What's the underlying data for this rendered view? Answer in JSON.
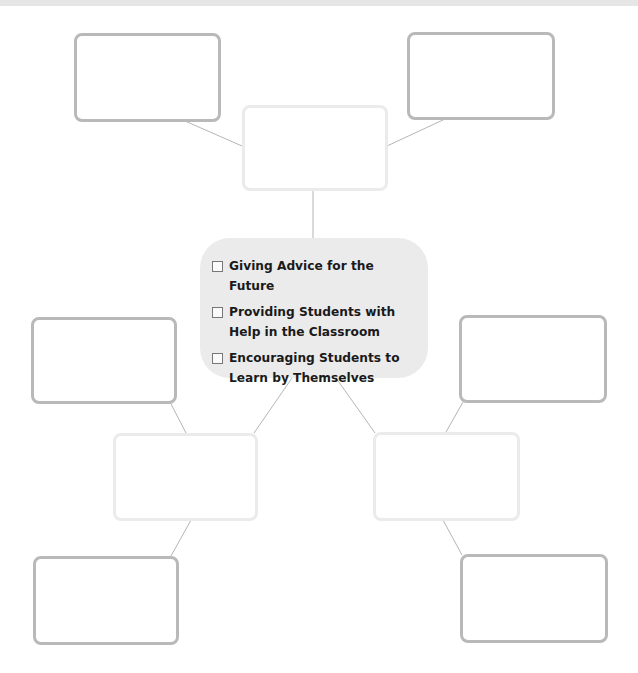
{
  "center": {
    "items": [
      {
        "label": "Giving Advice for the Future",
        "checked": false
      },
      {
        "label": "Providing Students with Help in the Classroom",
        "checked": false
      },
      {
        "label": "Encouraging Students to Learn by Themselves",
        "checked": false
      }
    ]
  },
  "nodes": {
    "top_left": "",
    "top_right": "",
    "top_middle": "",
    "mid_left": "",
    "mid_right": "",
    "lower_left": "",
    "lower_right": "",
    "bottom_left": "",
    "bottom_right": ""
  },
  "colors": {
    "center_fill": "#ebebeb",
    "dark_border": "#b9b9b9",
    "light_border": "#ebebeb",
    "connector": "#b5b5b5"
  }
}
